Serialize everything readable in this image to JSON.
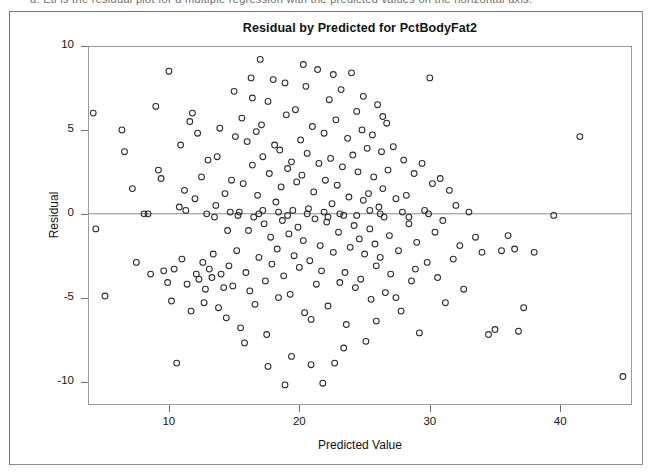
{
  "scan": {
    "top_fragment": "a. Eti is the residual plot for a multiple regression with the predicted values on the horizontal axis."
  },
  "figure": {
    "title": "Residual by Predicted for PctBodyFat2",
    "x_axis_title": "Predicted Value",
    "y_axis_title": "Residual"
  },
  "chart_data": {
    "type": "scatter",
    "title": "Residual by Predicted for PctBodyFat2",
    "xlabel": "Predicted Value",
    "ylabel": "Residual",
    "xlim": [
      3.8,
      45.5
    ],
    "ylim": [
      -11.4,
      10.0
    ],
    "xticks": [
      10,
      20,
      30,
      40
    ],
    "yticks": [
      -10,
      -5,
      0,
      5,
      10
    ],
    "grid": false,
    "legend": null,
    "marker": "open-circle",
    "marker_color": "#2b2b2b",
    "reference_lines": [
      {
        "orientation": "horizontal",
        "y": 0,
        "color": "#808080"
      }
    ],
    "n_points": 252,
    "points": [
      [
        4.2,
        6.0
      ],
      [
        4.4,
        -0.9
      ],
      [
        5.1,
        -4.9
      ],
      [
        6.6,
        3.7
      ],
      [
        6.4,
        5.0
      ],
      [
        7.2,
        1.5
      ],
      [
        7.5,
        -2.9
      ],
      [
        8.1,
        0.0
      ],
      [
        8.6,
        -3.6
      ],
      [
        9.0,
        6.4
      ],
      [
        9.2,
        2.6
      ],
      [
        9.4,
        2.1
      ],
      [
        9.6,
        -3.4
      ],
      [
        9.9,
        -4.1
      ],
      [
        10.0,
        8.5
      ],
      [
        10.2,
        -5.2
      ],
      [
        10.4,
        -3.3
      ],
      [
        10.6,
        -8.9
      ],
      [
        10.8,
        0.4
      ],
      [
        11.0,
        -2.7
      ],
      [
        11.2,
        1.4
      ],
      [
        11.4,
        -4.2
      ],
      [
        11.6,
        5.5
      ],
      [
        11.8,
        6.0
      ],
      [
        12.0,
        0.9
      ],
      [
        12.1,
        -3.6
      ],
      [
        12.3,
        -3.9
      ],
      [
        12.5,
        2.2
      ],
      [
        12.6,
        -2.9
      ],
      [
        12.8,
        -4.5
      ],
      [
        13.0,
        3.2
      ],
      [
        13.1,
        -3.3
      ],
      [
        13.3,
        -3.8
      ],
      [
        13.4,
        -2.4
      ],
      [
        13.6,
        0.5
      ],
      [
        13.8,
        -5.6
      ],
      [
        13.9,
        5.1
      ],
      [
        14.0,
        -3.6
      ],
      [
        14.2,
        -4.4
      ],
      [
        14.3,
        1.2
      ],
      [
        14.5,
        -1.0
      ],
      [
        14.6,
        -3.1
      ],
      [
        14.8,
        2.0
      ],
      [
        14.9,
        -4.3
      ],
      [
        15.0,
        7.3
      ],
      [
        15.1,
        4.6
      ],
      [
        15.2,
        -2.2
      ],
      [
        15.4,
        0.1
      ],
      [
        15.5,
        -6.8
      ],
      [
        15.6,
        5.7
      ],
      [
        15.7,
        1.8
      ],
      [
        15.9,
        -3.5
      ],
      [
        16.0,
        4.3
      ],
      [
        16.1,
        -1.0
      ],
      [
        16.2,
        -4.6
      ],
      [
        16.3,
        8.1
      ],
      [
        16.4,
        2.9
      ],
      [
        16.5,
        -0.2
      ],
      [
        16.6,
        -5.4
      ],
      [
        16.7,
        4.9
      ],
      [
        16.8,
        1.1
      ],
      [
        16.9,
        -2.6
      ],
      [
        17.0,
        9.2
      ],
      [
        17.1,
        5.3
      ],
      [
        17.2,
        3.4
      ],
      [
        17.3,
        -0.6
      ],
      [
        17.4,
        -4.0
      ],
      [
        17.5,
        -7.2
      ],
      [
        17.6,
        6.7
      ],
      [
        17.7,
        2.4
      ],
      [
        17.8,
        -1.4
      ],
      [
        17.9,
        -3.0
      ],
      [
        18.0,
        8.0
      ],
      [
        18.1,
        4.1
      ],
      [
        18.2,
        0.7
      ],
      [
        18.3,
        -2.1
      ],
      [
        18.4,
        -5.0
      ],
      [
        18.5,
        3.8
      ],
      [
        18.6,
        1.6
      ],
      [
        18.7,
        -0.4
      ],
      [
        18.8,
        -3.7
      ],
      [
        18.9,
        -10.2
      ],
      [
        19.0,
        5.9
      ],
      [
        19.1,
        2.7
      ],
      [
        19.2,
        -1.2
      ],
      [
        19.3,
        -4.8
      ],
      [
        19.4,
        3.1
      ],
      [
        19.5,
        0.2
      ],
      [
        19.6,
        -2.5
      ],
      [
        19.7,
        6.2
      ],
      [
        19.8,
        1.9
      ],
      [
        19.9,
        -0.8
      ],
      [
        20.0,
        -3.2
      ],
      [
        20.1,
        4.4
      ],
      [
        20.2,
        2.3
      ],
      [
        20.3,
        -1.6
      ],
      [
        20.4,
        -5.9
      ],
      [
        20.5,
        7.6
      ],
      [
        20.6,
        3.6
      ],
      [
        20.7,
        0.3
      ],
      [
        20.8,
        -2.8
      ],
      [
        20.9,
        -6.3
      ],
      [
        21.0,
        5.2
      ],
      [
        21.1,
        1.3
      ],
      [
        21.2,
        -0.3
      ],
      [
        21.3,
        -4.2
      ],
      [
        21.4,
        8.6
      ],
      [
        21.5,
        3.0
      ],
      [
        21.6,
        -1.9
      ],
      [
        21.7,
        -3.4
      ],
      [
        21.8,
        -10.1
      ],
      [
        21.9,
        4.8
      ],
      [
        22.0,
        2.0
      ],
      [
        22.1,
        -0.5
      ],
      [
        22.2,
        -5.5
      ],
      [
        22.3,
        6.8
      ],
      [
        22.4,
        3.3
      ],
      [
        22.5,
        0.6
      ],
      [
        22.6,
        -2.3
      ],
      [
        22.7,
        -8.9
      ],
      [
        22.8,
        5.6
      ],
      [
        22.9,
        1.7
      ],
      [
        23.0,
        -1.1
      ],
      [
        23.1,
        -4.1
      ],
      [
        23.2,
        7.4
      ],
      [
        23.3,
        2.8
      ],
      [
        23.4,
        -0.1
      ],
      [
        23.5,
        -3.5
      ],
      [
        23.6,
        -6.6
      ],
      [
        23.7,
        4.5
      ],
      [
        23.8,
        1.0
      ],
      [
        23.9,
        -2.0
      ],
      [
        24.0,
        8.4
      ],
      [
        24.1,
        3.5
      ],
      [
        24.2,
        -0.7
      ],
      [
        24.3,
        -4.4
      ],
      [
        24.4,
        6.1
      ],
      [
        24.5,
        2.5
      ],
      [
        24.6,
        -1.5
      ],
      [
        24.7,
        -3.9
      ],
      [
        24.8,
        5.0
      ],
      [
        24.9,
        0.8
      ],
      [
        25.0,
        -2.4
      ],
      [
        25.1,
        -7.6
      ],
      [
        25.2,
        3.9
      ],
      [
        25.3,
        1.2
      ],
      [
        25.4,
        -0.9
      ],
      [
        25.5,
        -5.1
      ],
      [
        25.6,
        4.7
      ],
      [
        25.7,
        2.2
      ],
      [
        25.8,
        -1.8
      ],
      [
        25.9,
        -3.1
      ],
      [
        26.0,
        6.5
      ],
      [
        26.1,
        0.4
      ],
      [
        26.2,
        -2.6
      ],
      [
        26.3,
        3.7
      ],
      [
        26.4,
        1.5
      ],
      [
        26.5,
        -0.2
      ],
      [
        26.6,
        -4.7
      ],
      [
        26.7,
        5.4
      ],
      [
        26.8,
        2.6
      ],
      [
        26.9,
        -1.3
      ],
      [
        27.0,
        -3.6
      ],
      [
        27.2,
        4.0
      ],
      [
        27.4,
        0.9
      ],
      [
        27.6,
        -2.2
      ],
      [
        27.8,
        -5.8
      ],
      [
        28.0,
        3.2
      ],
      [
        28.2,
        1.1
      ],
      [
        28.4,
        -0.6
      ],
      [
        28.6,
        -4.0
      ],
      [
        28.8,
        2.4
      ],
      [
        29.0,
        -1.7
      ],
      [
        29.2,
        -7.1
      ],
      [
        29.4,
        3.0
      ],
      [
        29.6,
        0.2
      ],
      [
        29.8,
        -2.9
      ],
      [
        30.0,
        8.1
      ],
      [
        30.2,
        1.8
      ],
      [
        30.4,
        -1.1
      ],
      [
        30.6,
        -3.8
      ],
      [
        30.8,
        2.1
      ],
      [
        31.0,
        -0.4
      ],
      [
        31.2,
        -5.3
      ],
      [
        31.5,
        1.4
      ],
      [
        31.8,
        -2.7
      ],
      [
        32.0,
        0.5
      ],
      [
        32.3,
        -1.9
      ],
      [
        32.6,
        -4.5
      ],
      [
        33.0,
        0.1
      ],
      [
        33.5,
        -1.4
      ],
      [
        34.0,
        -2.3
      ],
      [
        34.5,
        -7.2
      ],
      [
        35.0,
        -6.9
      ],
      [
        35.5,
        -2.2
      ],
      [
        36.0,
        -1.3
      ],
      [
        36.5,
        -2.1
      ],
      [
        36.8,
        -7.0
      ],
      [
        37.2,
        -5.6
      ],
      [
        38.0,
        -2.3
      ],
      [
        39.5,
        -0.1
      ],
      [
        41.5,
        4.6
      ],
      [
        44.8,
        -9.7
      ],
      [
        12.9,
        0.0
      ],
      [
        14.7,
        0.1
      ],
      [
        15.3,
        -0.1
      ],
      [
        16.9,
        0.0
      ],
      [
        18.4,
        0.1
      ],
      [
        19.1,
        -0.1
      ],
      [
        20.6,
        0.0
      ],
      [
        21.9,
        0.1
      ],
      [
        23.1,
        0.0
      ],
      [
        24.4,
        -0.1
      ],
      [
        26.2,
        0.0
      ],
      [
        27.9,
        0.1
      ],
      [
        29.9,
        0.0
      ],
      [
        8.4,
        0.0
      ],
      [
        11.3,
        0.2
      ],
      [
        13.5,
        -0.2
      ],
      [
        17.2,
        0.2
      ],
      [
        22.2,
        -0.2
      ],
      [
        25.4,
        0.2
      ],
      [
        28.4,
        -0.2
      ],
      [
        12.2,
        4.8
      ],
      [
        13.7,
        3.4
      ],
      [
        10.9,
        4.1
      ],
      [
        16.4,
        6.9
      ],
      [
        18.9,
        7.8
      ],
      [
        20.3,
        8.9
      ],
      [
        22.6,
        8.3
      ],
      [
        24.9,
        7.0
      ],
      [
        26.4,
        5.8
      ],
      [
        19.4,
        -8.5
      ],
      [
        20.9,
        -9.0
      ],
      [
        17.6,
        -9.1
      ],
      [
        15.8,
        -7.7
      ],
      [
        23.4,
        -8.0
      ],
      [
        25.9,
        -6.4
      ],
      [
        14.4,
        -6.2
      ],
      [
        12.7,
        -5.3
      ],
      [
        11.7,
        -5.8
      ],
      [
        27.4,
        -5.0
      ],
      [
        28.9,
        -3.3
      ]
    ]
  },
  "axis_labels": {
    "y": [
      "10",
      "5",
      "0",
      "-5",
      "-10"
    ],
    "x": [
      "10",
      "20",
      "30",
      "40"
    ]
  }
}
